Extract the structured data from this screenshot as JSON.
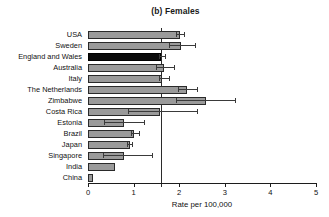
{
  "chart_data": {
    "type": "bar",
    "orientation": "horizontal",
    "title": "(b) Females",
    "xlabel": "Rate per 100,000",
    "ylabel": "",
    "xlim": [
      0,
      5
    ],
    "xticks": [
      0,
      1,
      2,
      3,
      4,
      5
    ],
    "xtick_labels": [
      "0",
      "1",
      "2",
      "3",
      "4",
      "5"
    ],
    "grid": false,
    "legend": null,
    "reference_line": 1.6,
    "highlight_category": "England and Wales",
    "categories": [
      "USA",
      "Sweden",
      "England and Wales",
      "Australia",
      "Italy",
      "The Netherlands",
      "Zimbabwe",
      "Costa Rica",
      "Estonia",
      "Brazil",
      "Japan",
      "Singapore",
      "India",
      "China"
    ],
    "values": [
      2.02,
      2.03,
      1.6,
      1.67,
      1.62,
      2.17,
      2.59,
      1.58,
      0.79,
      1.0,
      0.92,
      0.8,
      0.6,
      0.11
    ],
    "error_low": [
      1.93,
      1.78,
      1.55,
      1.5,
      1.55,
      1.97,
      1.93,
      0.87,
      0.36,
      0.94,
      0.86,
      0.32,
      0.6,
      0.11
    ],
    "error_high": [
      2.1,
      2.35,
      1.68,
      1.88,
      1.78,
      2.4,
      3.22,
      2.39,
      1.23,
      1.11,
      0.97,
      1.4,
      0.6,
      0.11
    ],
    "colors": {
      "bar_fill": "#9a9a9a",
      "bar_highlight": "#0a0a0a",
      "bar_edge": "#2a2a2a",
      "error": "#3a3a3a",
      "axis": "#1c1c1c",
      "reference_line": "#2b2b2b",
      "background": "#ffffff"
    }
  }
}
